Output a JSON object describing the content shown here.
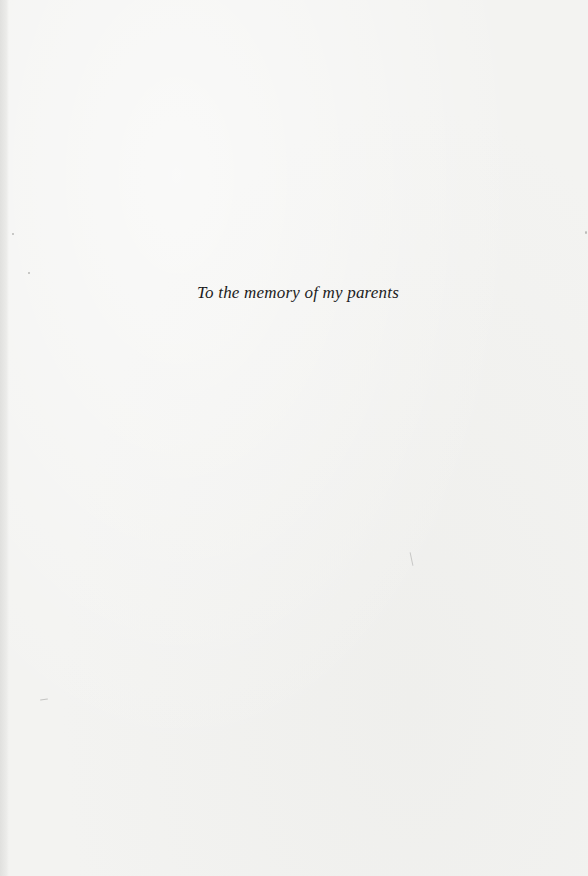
{
  "page": {
    "type": "dedication",
    "dedication_text": "To the memory of my parents"
  },
  "colors": {
    "paper": "#f3f3f1",
    "text": "#1c1c1c",
    "edge_shadow": "#e0e0de"
  }
}
